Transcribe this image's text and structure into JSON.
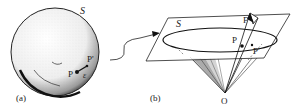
{
  "figure": {
    "panel_a": {
      "label": "(a)",
      "sphere_label": "S",
      "point_p": "P",
      "point_p_prime": "P'",
      "epsilon": "ε"
    },
    "panel_b": {
      "label": "(b)",
      "plane_label": "S",
      "point_f": "F",
      "point_p": "P",
      "point_p_prime": "P'",
      "origin": "O"
    },
    "colors": {
      "ink": "#222222",
      "shade": "#8a8a8a",
      "background": "#ffffff"
    }
  }
}
